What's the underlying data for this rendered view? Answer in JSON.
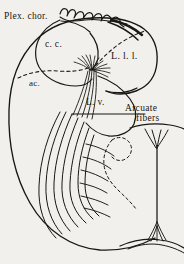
{
  "figure": {
    "name": "coronal-section-cerebral-hemisphere",
    "background_color": "#f2f0ec",
    "ink_color": "#1a1713",
    "style": "engraved-line-drawing"
  },
  "labels": {
    "plex_chor": "Plex. chor.",
    "cc": "c. c.",
    "lll": "L. l. l.",
    "ac": "ac.",
    "lv": "L. v.",
    "arcuate_line1": "Arcuate",
    "arcuate_line2": "fibers"
  },
  "structures": [
    {
      "key": "plex_chor",
      "label": "Plex. chor.",
      "feature": "choroid-plexus-scalloped-ribbon"
    },
    {
      "key": "cc",
      "label": "c. c.",
      "feature": "corpus-callosum"
    },
    {
      "key": "lll",
      "label": "L. l. l.",
      "feature": "lobule"
    },
    {
      "key": "ac",
      "label": "ac.",
      "feature": "anterior-commissure"
    },
    {
      "key": "lv",
      "label": "L. v.",
      "feature": "lateral-ventricle"
    },
    {
      "key": "arcuate",
      "label": "Arcuate fibers",
      "feature": "arcuate-fiber-bundles",
      "leader": true
    }
  ]
}
